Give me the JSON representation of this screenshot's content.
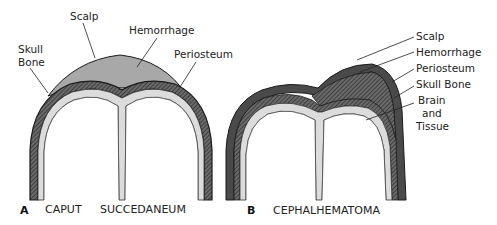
{
  "panels": [
    {
      "letter": "A",
      "title_word1": "CAPUT",
      "title_word2": "SUCCEDANEUM",
      "labels": {
        "scalp": "Scalp",
        "hemorrhage": "Hemorrhage",
        "periosteum": "Periosteum",
        "skull_line1": "Skull",
        "skull_line2": "Bone"
      }
    },
    {
      "letter": "B",
      "title": "CEPHALHEMATOMA",
      "labels": {
        "scalp": "Scalp",
        "hemorrhage": "Hemorrhage",
        "periosteum": "Periosteum",
        "skull": "Skull Bone",
        "brain_line1": "Brain",
        "brain_line2": "and",
        "brain_line3": "Tissue"
      }
    }
  ],
  "colors": {
    "hemorrhage": "#a6a6a6",
    "scalp_band": "#555555",
    "bone": "#2e2e2e",
    "tissue_gap": "#dcdcdc",
    "outline": "#1a1a1a"
  }
}
